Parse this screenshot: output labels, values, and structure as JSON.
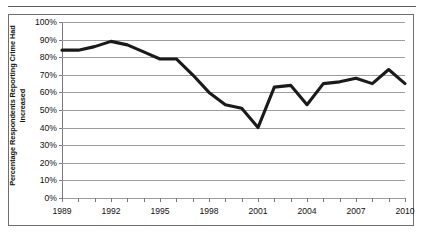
{
  "chart_data": {
    "type": "line",
    "title": "",
    "xlabel": "",
    "ylabel": "Percentage Respondents Reporting Crime Had Increased",
    "ylabel_lines": [
      "Percentage Respondents Reporting Crime Had",
      "Increased"
    ],
    "ylim": [
      0,
      100
    ],
    "xlim": [
      1989,
      2010
    ],
    "grid": true,
    "legend": "none",
    "y_tick_labels": [
      "100%",
      "90%",
      "80%",
      "70%",
      "60%",
      "50%",
      "40%",
      "30%",
      "20%",
      "10%",
      "0%"
    ],
    "y_tick_values": [
      100,
      90,
      80,
      70,
      60,
      50,
      40,
      30,
      20,
      10,
      0
    ],
    "x_tick_labels": [
      "1989",
      "1992",
      "1995",
      "1998",
      "2001",
      "2004",
      "2007",
      "2010"
    ],
    "x_tick_values": [
      1989,
      1992,
      1995,
      1998,
      2001,
      2004,
      2007,
      2010
    ],
    "x_minor_ticks": [
      1989,
      1990,
      1991,
      1992,
      1993,
      1994,
      1995,
      1996,
      1997,
      1998,
      1999,
      2000,
      2001,
      2002,
      2003,
      2004,
      2005,
      2006,
      2007,
      2008,
      2009,
      2010
    ],
    "series": [
      {
        "name": "Percentage respondents reporting crime had increased",
        "color": "#1a1a1a",
        "x": [
          1989,
          1990,
          1991,
          1992,
          1993,
          1994,
          1995,
          1996,
          1997,
          1998,
          1999,
          2000,
          2001,
          2002,
          2003,
          2004,
          2005,
          2006,
          2007,
          2008,
          2009,
          2010
        ],
        "values": [
          84,
          84,
          86,
          89,
          87,
          83,
          79,
          79,
          70,
          60,
          53,
          51,
          40,
          63,
          64,
          53,
          65,
          66,
          68,
          65,
          73,
          65
        ]
      }
    ]
  }
}
